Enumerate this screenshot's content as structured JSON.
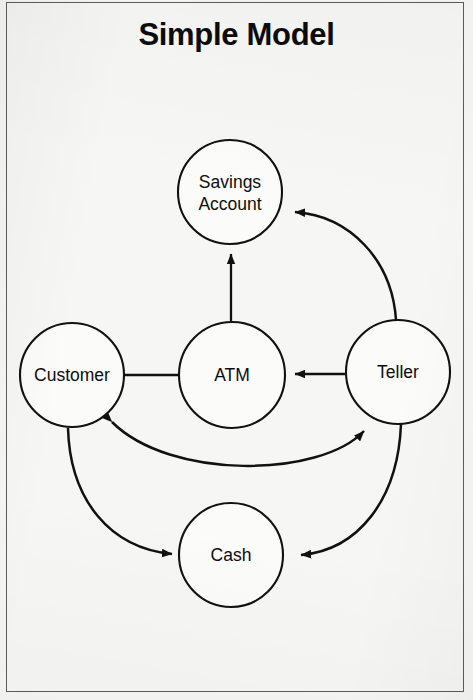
{
  "page": {
    "title": "Simple Model",
    "background_color": "#f6f6f4",
    "border_color": "#5a5c5e",
    "ink_color": "#111111",
    "node_fill_color": "#fbfbfa"
  },
  "diagram": {
    "type": "node-link-graph",
    "nodes": [
      {
        "id": "savings-account",
        "label_line1": "Savings",
        "label_line2": "Account",
        "cx": 230,
        "cy": 192,
        "r": 52
      },
      {
        "id": "customer",
        "label_line1": "Customer",
        "label_line2": "",
        "cx": 72,
        "cy": 375,
        "r": 52
      },
      {
        "id": "atm",
        "label_line1": "ATM",
        "label_line2": "",
        "cx": 232,
        "cy": 375,
        "r": 53
      },
      {
        "id": "teller",
        "label_line1": "Teller",
        "label_line2": "",
        "cx": 398,
        "cy": 372,
        "r": 52
      },
      {
        "id": "cash",
        "label_line1": "Cash",
        "label_line2": "",
        "cx": 231,
        "cy": 555,
        "r": 52
      }
    ],
    "edges": [
      {
        "id": "customer-to-atm",
        "from": "customer",
        "to": "atm",
        "shape": "straight",
        "arrows": "to"
      },
      {
        "id": "teller-to-atm",
        "from": "teller",
        "to": "atm",
        "shape": "straight",
        "arrows": "to"
      },
      {
        "id": "atm-to-savings",
        "from": "atm",
        "to": "savings-account",
        "shape": "straight",
        "arrows": "to"
      },
      {
        "id": "teller-to-savings",
        "from": "teller",
        "to": "savings-account",
        "shape": "curved",
        "arrows": "to"
      },
      {
        "id": "customer-teller-return",
        "from": "teller",
        "to": "customer",
        "shape": "curved",
        "arrows": "both"
      },
      {
        "id": "customer-to-cash",
        "from": "customer",
        "to": "cash",
        "shape": "curved",
        "arrows": "to"
      },
      {
        "id": "teller-to-cash",
        "from": "teller",
        "to": "cash",
        "shape": "curved",
        "arrows": "to"
      }
    ]
  }
}
